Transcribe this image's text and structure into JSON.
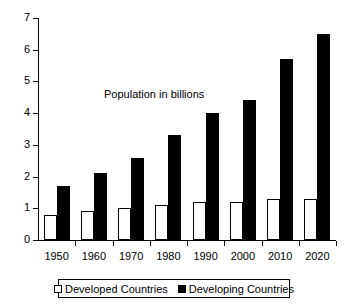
{
  "chart_data": {
    "type": "bar",
    "title": "Population in billions",
    "xlabel": "",
    "ylabel": "",
    "ylim": [
      0,
      7
    ],
    "ytick_labels": [
      "0",
      "1",
      "2",
      "3",
      "4",
      "5",
      "6",
      "7"
    ],
    "yticks": [
      0,
      1,
      2,
      3,
      4,
      5,
      6,
      7
    ],
    "grid": false,
    "legend_position": "bottom",
    "categories": [
      "1950",
      "1960",
      "1970",
      "1980",
      "1990",
      "2000",
      "2010",
      "2020"
    ],
    "series": [
      {
        "name": "Developed Countries",
        "color": "#ffffff",
        "edge_color": "#000000",
        "values": [
          0.8,
          0.9,
          1.0,
          1.1,
          1.2,
          1.2,
          1.3,
          1.3
        ]
      },
      {
        "name": "Developing Countries",
        "color": "#000000",
        "edge_color": "#000000",
        "values": [
          1.7,
          2.1,
          2.6,
          3.3,
          4.0,
          4.4,
          5.7,
          6.5
        ]
      }
    ]
  },
  "legend": {
    "entries": [
      {
        "label": "Developed Countries",
        "swatch": "white-square-icon"
      },
      {
        "label": "Developing Countries",
        "swatch": "black-square-icon"
      }
    ]
  },
  "colors": {
    "axis": "#000000",
    "background": "#ffffff",
    "developed": "#ffffff",
    "developing": "#000000"
  }
}
